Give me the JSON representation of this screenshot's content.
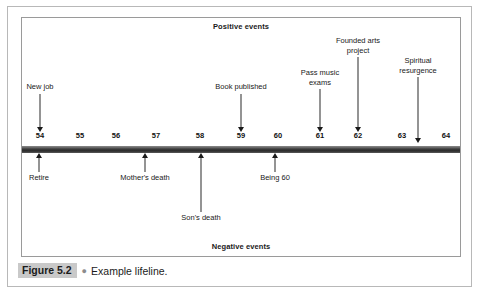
{
  "figure": {
    "caption_tag": "Figure 5.2",
    "caption_bullet": "●",
    "caption_text": "Example lifeline."
  },
  "diagram": {
    "positive_band_label": "Positive events",
    "negative_band_label": "Negative events",
    "colors": {
      "timeline_bar": "#3a3a3a",
      "arrow": "#1a1a1a",
      "box_border": "#9a9a9a",
      "outer_border": "#b8b8b8",
      "caption_tag_bg": "#c9c9c9"
    }
  },
  "chart_data": {
    "type": "timeline",
    "title": "Example lifeline.",
    "xlabel": "Age",
    "ylabel": "",
    "xlim": [
      54,
      64
    ],
    "grid": false,
    "axis_ticks": [
      {
        "label": "54",
        "value": 54,
        "x": 40
      },
      {
        "label": "55",
        "value": 55,
        "x": 80
      },
      {
        "label": "56",
        "value": 56,
        "x": 116
      },
      {
        "label": "57",
        "value": 57,
        "x": 156
      },
      {
        "label": "58",
        "value": 58,
        "x": 200
      },
      {
        "label": "59",
        "value": 59,
        "x": 241
      },
      {
        "label": "60",
        "value": 60,
        "x": 278
      },
      {
        "label": "61",
        "value": 61,
        "x": 320
      },
      {
        "label": "62",
        "value": 62,
        "x": 358
      },
      {
        "label": "63",
        "value": 63,
        "x": 402
      },
      {
        "label": "64",
        "value": 64,
        "x": 446
      }
    ],
    "series": [
      {
        "name": "Positive events",
        "side": "above",
        "events": [
          {
            "label": "New job",
            "age": 54,
            "x": 40,
            "label_top": 82,
            "label_lines": 1
          },
          {
            "label": "Book published",
            "age": 59,
            "x": 241,
            "label_top": 82,
            "label_lines": 1
          },
          {
            "label": "Pass music\nexams",
            "age": 61,
            "x": 320,
            "label_top": 68,
            "label_lines": 2
          },
          {
            "label": "Founded arts\nproject",
            "age": 62,
            "x": 358,
            "label_top": 36,
            "label_lines": 2
          },
          {
            "label": "Spiritual\nresurgence",
            "age": 63.5,
            "x": 418,
            "label_top": 56,
            "label_lines": 2
          }
        ]
      },
      {
        "name": "Negative events",
        "side": "below",
        "events": [
          {
            "label": "Retire",
            "age": 54,
            "x": 39,
            "label_top": 173
          },
          {
            "label": "Mother's death",
            "age": 56.6,
            "x": 145,
            "label_top": 173
          },
          {
            "label": "Son's death",
            "age": 58.1,
            "x": 201,
            "label_top": 213
          },
          {
            "label": "Being 60",
            "age": 59.9,
            "x": 275,
            "label_top": 173
          }
        ]
      }
    ]
  }
}
